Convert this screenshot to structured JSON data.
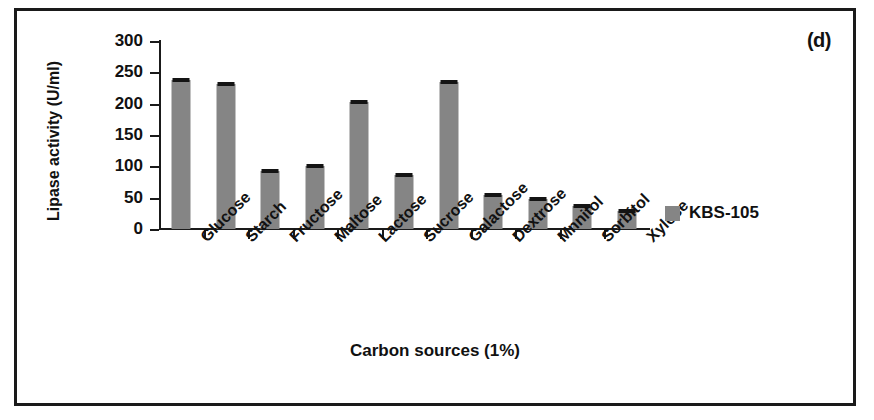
{
  "figure": {
    "panel_label": "(d)"
  },
  "legend": {
    "entries": [
      {
        "label": "KBS-105",
        "color": "#858585"
      }
    ],
    "position": "right"
  },
  "chart_data": {
    "type": "bar",
    "title": "",
    "subtitle": "",
    "panel_label": "(d)",
    "xlabel": "Carbon sources (1%)",
    "ylabel": "Lipase activity (U/ml)",
    "categories": [
      "Glucose",
      "Starch",
      "Fructose",
      "Maltose",
      "Lactose",
      "Sucrose",
      "Galactose",
      "Dextrose",
      "Mnnitol",
      "Sorbitol",
      "Xylose"
    ],
    "series": [
      {
        "name": "KBS-105",
        "color": "#858585",
        "values": [
          238,
          231,
          92,
          100,
          203,
          86,
          235,
          55,
          48,
          36,
          29
        ],
        "errors": [
          4,
          3,
          3,
          3,
          3,
          3,
          3,
          3,
          3,
          3,
          3
        ]
      }
    ],
    "ylim": [
      0,
      300
    ],
    "yticks": [
      0,
      50,
      100,
      150,
      200,
      250,
      300
    ],
    "ytick_labels": [
      "0",
      "50",
      "100",
      "150",
      "200",
      "250",
      "300"
    ],
    "grid": false,
    "xtick_label_rotation": -45,
    "bar_color": "#858585",
    "axis_color": "#1a1a1a",
    "error_bar_color": "#141414"
  }
}
